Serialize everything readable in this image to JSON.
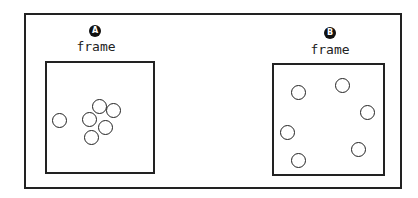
{
  "panels": [
    {
      "badge": "A",
      "label": "frame",
      "circles": [
        {
          "x": 59,
          "y": 120
        },
        {
          "x": 89,
          "y": 119
        },
        {
          "x": 99,
          "y": 106
        },
        {
          "x": 113,
          "y": 110
        },
        {
          "x": 105,
          "y": 127
        },
        {
          "x": 91,
          "y": 137
        }
      ]
    },
    {
      "badge": "B",
      "label": "frame",
      "circles": [
        {
          "x": 298,
          "y": 92
        },
        {
          "x": 342,
          "y": 85
        },
        {
          "x": 367,
          "y": 112
        },
        {
          "x": 287,
          "y": 132
        },
        {
          "x": 358,
          "y": 149
        },
        {
          "x": 298,
          "y": 160
        }
      ]
    }
  ]
}
